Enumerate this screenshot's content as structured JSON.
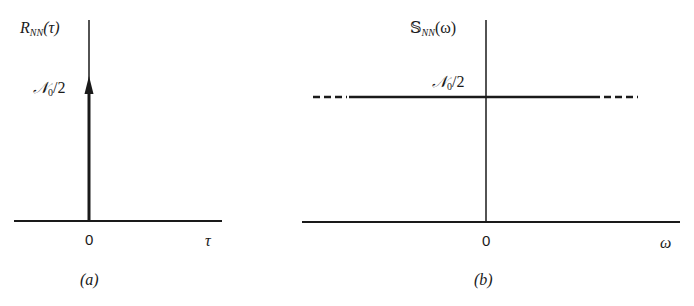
{
  "panels": [
    {
      "id": "a",
      "caption": "(a)",
      "ylabel": {
        "symbol": "R",
        "subscript": "NN",
        "arg": "(τ)"
      },
      "xlabel": "τ",
      "origin_tick": "0",
      "level_label": {
        "symbol": "𝒩",
        "subscript": "0",
        "suffix": "/2"
      },
      "description": "Autocorrelation of white noise: impulse at τ=0 with weight 𝒩0/2"
    },
    {
      "id": "b",
      "caption": "(b)",
      "ylabel": {
        "symbol": "𝕊",
        "subscript": "NN",
        "arg": "(ω)"
      },
      "xlabel": "ω",
      "origin_tick": "0",
      "level_label": {
        "symbol": "𝒩",
        "subscript": "0",
        "suffix": "/2"
      },
      "description": "Power spectral density of white noise: constant 𝒩0/2 for all ω, dashed extensions indicating continuation"
    }
  ],
  "colors": {
    "ink": "#1a1a1a",
    "background": "#ffffff"
  }
}
